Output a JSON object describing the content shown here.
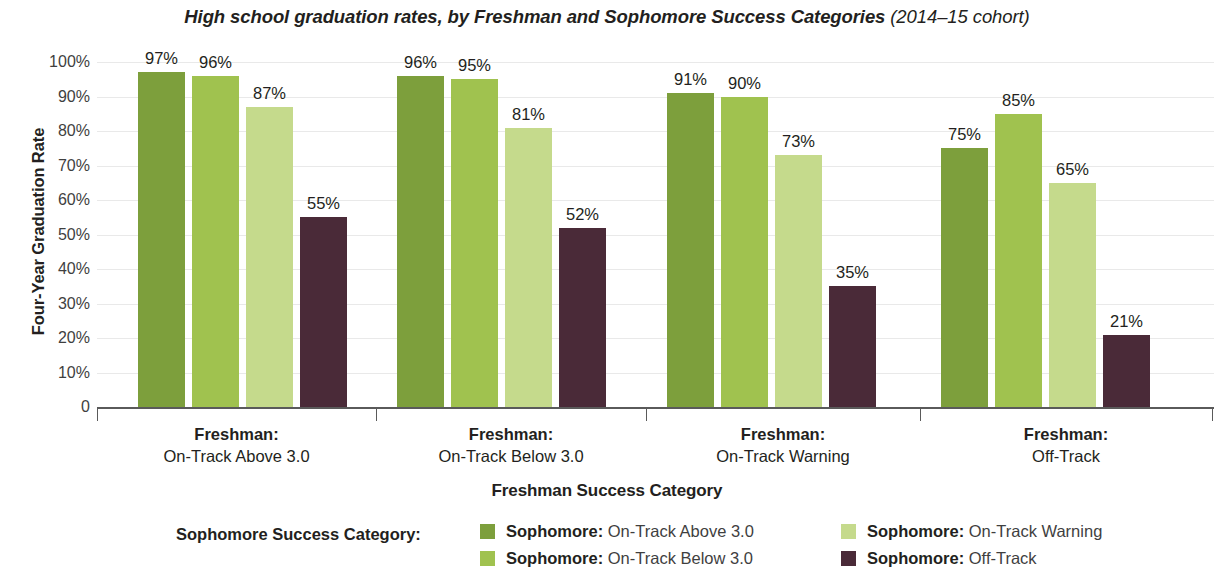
{
  "title": {
    "main": "High school graduation rates, by Freshman and Sophomore Success Categories",
    "cohort": "(2014–15 cohort)"
  },
  "axes": {
    "y_title": "Four-Year Graduation Rate",
    "x_title": "Freshman Success Category",
    "y_ticks": [
      "100%",
      "90%",
      "80%",
      "70%",
      "60%",
      "50%",
      "40%",
      "30%",
      "20%",
      "10%",
      "0"
    ]
  },
  "legend": {
    "title": "Sophomore Success Category:",
    "items": [
      {
        "prefix": "Sophomore:",
        "label": " On-Track Above 3.0",
        "color": "#7d9f3c"
      },
      {
        "prefix": "Sophomore:",
        "label": " On-Track Below 3.0",
        "color": "#a0c24f"
      },
      {
        "prefix": "Sophomore:",
        "label": " On-Track Warning",
        "color": "#c5da8c"
      },
      {
        "prefix": "Sophomore:",
        "label": " Off-Track",
        "color": "#4a2a38"
      }
    ]
  },
  "groups": [
    {
      "top": "Freshman:",
      "bottom": "On-Track Above 3.0"
    },
    {
      "top": "Freshman:",
      "bottom": "On-Track Below 3.0"
    },
    {
      "top": "Freshman:",
      "bottom": "On-Track Warning"
    },
    {
      "top": "Freshman:",
      "bottom": "Off-Track"
    }
  ],
  "chart_data": {
    "type": "bar",
    "title": "High school graduation rates, by Freshman and Sophomore Success Categories (2014–15 cohort)",
    "xlabel": "Freshman Success Category",
    "ylabel": "Four-Year Graduation Rate",
    "ylim": [
      0,
      100
    ],
    "ytick_step": 10,
    "grid": true,
    "legend_position": "bottom",
    "value_labels": true,
    "categories": [
      "Freshman: On-Track Above 3.0",
      "Freshman: On-Track Below 3.0",
      "Freshman: On-Track Warning",
      "Freshman: Off-Track"
    ],
    "series": [
      {
        "name": "Sophomore: On-Track Above 3.0",
        "color": "#7d9f3c",
        "values": [
          97,
          96,
          91,
          75
        ],
        "labels": [
          "97%",
          "96%",
          "91%",
          "75%"
        ]
      },
      {
        "name": "Sophomore: On-Track Below 3.0",
        "color": "#a0c24f",
        "values": [
          96,
          95,
          90,
          85
        ],
        "labels": [
          "96%",
          "95%",
          "90%",
          "85%"
        ]
      },
      {
        "name": "Sophomore: On-Track Warning",
        "color": "#c5da8c",
        "values": [
          87,
          81,
          73,
          65
        ],
        "labels": [
          "87%",
          "81%",
          "73%",
          "65%"
        ]
      },
      {
        "name": "Sophomore: Off-Track",
        "color": "#4a2a38",
        "values": [
          55,
          52,
          35,
          21
        ],
        "labels": [
          "55%",
          "52%",
          "35%",
          "21%"
        ]
      }
    ]
  }
}
